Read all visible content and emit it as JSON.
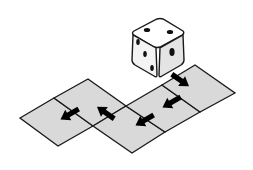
{
  "diagram": {
    "colors": {
      "background": "#ffffff",
      "tile_fill": "#d9d9d9",
      "tile_stroke": "#1a1a1a",
      "arrow": "#000000",
      "die_top": "#ffffff",
      "die_left": "#f2f2f2",
      "die_right": "#e6e6e6",
      "pip": "#111111"
    },
    "die": {
      "top_face_pips": 2,
      "left_face_pips": 3,
      "right_face_pips": 1
    },
    "tiles": [
      {
        "id": "tile-a",
        "points": "20,118 54,98 93,126 58,146"
      },
      {
        "id": "tile-b",
        "points": "54,98 88,79 126,106 93,126"
      },
      {
        "id": "tile-c",
        "points": "93,126 126,106 165,132 132,153"
      },
      {
        "id": "tile-d",
        "points": "126,106 162,85 200,112 165,132"
      },
      {
        "id": "tile-e",
        "points": "162,85 195,65 235,93 200,112"
      }
    ],
    "arrows": [
      {
        "id": "arrow-1",
        "direction": "down-right",
        "x": 180,
        "y": 80,
        "angle": 35
      },
      {
        "id": "arrow-2",
        "direction": "down-left",
        "x": 172,
        "y": 102,
        "angle": 150
      },
      {
        "id": "arrow-3",
        "direction": "down-left",
        "x": 145,
        "y": 120,
        "angle": 150
      },
      {
        "id": "arrow-4",
        "direction": "up-left",
        "x": 106,
        "y": 113,
        "angle": 215
      },
      {
        "id": "arrow-5",
        "direction": "down-left",
        "x": 70,
        "y": 114,
        "angle": 150
      }
    ]
  }
}
